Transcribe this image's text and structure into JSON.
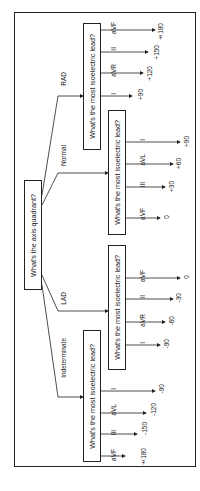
{
  "diagram": {
    "type": "flowchart",
    "orientation": "rotated-90-ccw",
    "root": {
      "question": "What's the axis quadrant?"
    },
    "branches": [
      {
        "label": "RAD",
        "question": "What's the most isoelectric lead?",
        "leads": [
          {
            "lead": "I",
            "axis": "+90"
          },
          {
            "lead": "aVR",
            "axis": "+120"
          },
          {
            "lead": "II",
            "axis": "+150"
          },
          {
            "lead": "aVF",
            "axis": "±180"
          }
        ]
      },
      {
        "label": "Normal",
        "question": "What's the most isoelectric lead?",
        "leads": [
          {
            "lead": "aVF",
            "axis": "0"
          },
          {
            "lead": "III",
            "axis": "+30"
          },
          {
            "lead": "aVL",
            "axis": "+60"
          },
          {
            "lead": "I",
            "axis": "+90"
          }
        ]
      },
      {
        "label": "LAD",
        "question": "What's the most isoelectric lead?",
        "leads": [
          {
            "lead": "I",
            "axis": "-90"
          },
          {
            "lead": "aVR",
            "axis": "-60"
          },
          {
            "lead": "II",
            "axis": "-30"
          },
          {
            "lead": "aVF",
            "axis": "0"
          }
        ]
      },
      {
        "label": "Indeterminate",
        "question": "What's the most isoelectric lead?",
        "leads": [
          {
            "lead": "aVF",
            "axis": "±180"
          },
          {
            "lead": "III",
            "axis": "-150"
          },
          {
            "lead": "aVL",
            "axis": "-120"
          },
          {
            "lead": "I",
            "axis": "-90"
          }
        ]
      }
    ]
  }
}
